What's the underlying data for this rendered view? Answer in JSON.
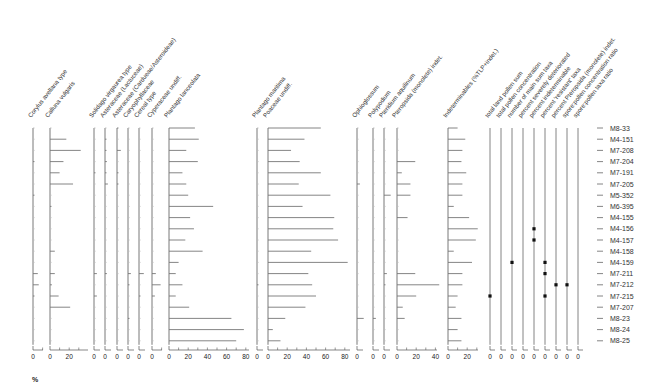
{
  "chart_data": {
    "type": "bar",
    "subtype": "stratigraphic pollen diagram (horizontal bars per sample)",
    "title": "",
    "xlabel": "%",
    "samples": [
      "M8-33",
      "M4-151",
      "M7-208",
      "M7-204",
      "M7-191",
      "M7-205",
      "M5-352",
      "M6-395",
      "M4-155",
      "M4-156",
      "M4-157",
      "M4-158",
      "M4-159",
      "M7-211",
      "M7-212",
      "M7-215",
      "M7-207",
      "M8-23",
      "M8-24",
      "M8-25"
    ],
    "series": [
      {
        "name": "Corylus avellana type",
        "x0": 33,
        "scale": 0.96,
        "ticks": [
          0
        ],
        "axis_len": 10,
        "values": [
          0,
          0,
          0,
          1,
          0,
          0,
          1,
          0,
          0,
          0,
          0,
          0,
          0,
          5,
          6,
          1,
          0,
          0,
          0,
          0
        ]
      },
      {
        "name": "Calluna vulgaris",
        "x0": 50,
        "scale": 0.96,
        "ticks": [
          0,
          20
        ],
        "axis_len": 38,
        "values": [
          0,
          17,
          32,
          14,
          10,
          24,
          0,
          1,
          0,
          0,
          0,
          5,
          0,
          5,
          2,
          9,
          21,
          0,
          0,
          0
        ]
      },
      {
        "name": "Solidago virgaurea type",
        "x0": 94,
        "scale": 0.96,
        "ticks": [
          0
        ],
        "axis_len": 6,
        "values": [
          0,
          0,
          0,
          0,
          1,
          0,
          0,
          0,
          0,
          0,
          0,
          0,
          0,
          3,
          0,
          3,
          0,
          0,
          0,
          0
        ]
      },
      {
        "name": "Asteraceae (Lactuceae)",
        "x0": 105,
        "scale": 0.96,
        "ticks": [
          0
        ],
        "axis_len": 6,
        "values": [
          0,
          1,
          1,
          2,
          1,
          3,
          0,
          0,
          0,
          0,
          0,
          0,
          0,
          2,
          0,
          0,
          0,
          0,
          0,
          0
        ]
      },
      {
        "name": "Asteraceae (Cardueae/Asteroideae)",
        "x0": 117,
        "scale": 0.96,
        "ticks": [
          0
        ],
        "axis_len": 6,
        "values": [
          1,
          0,
          4,
          0,
          1,
          1,
          0,
          0,
          0,
          0,
          0,
          0,
          0,
          0,
          0,
          0,
          0,
          0,
          0,
          0
        ]
      },
      {
        "name": "Caryophyllaceae",
        "x0": 128,
        "scale": 0.96,
        "ticks": [
          0
        ],
        "axis_len": 6,
        "values": [
          0,
          0,
          0,
          0,
          0,
          0,
          0,
          0,
          0,
          0,
          0,
          0,
          0,
          3,
          1,
          0,
          0,
          1,
          0,
          0
        ]
      },
      {
        "name": "Cereal type",
        "x0": 139,
        "scale": 0.96,
        "ticks": [
          0
        ],
        "axis_len": 6,
        "values": [
          0,
          0,
          0,
          0,
          0,
          0,
          0,
          0,
          0,
          0,
          0,
          0,
          0,
          5,
          0,
          1,
          0,
          0,
          0,
          0
        ]
      },
      {
        "name": "Cyperaceae undiff.",
        "x0": 152,
        "scale": 0.96,
        "ticks": [
          0
        ],
        "axis_len": 10,
        "values": [
          0,
          0,
          0,
          0,
          0,
          0,
          0,
          0,
          0,
          0,
          0,
          0,
          0,
          4,
          9,
          3,
          0,
          0,
          0,
          0
        ]
      },
      {
        "name": "Plantago lanceolata",
        "x0": 169,
        "scale": 0.96,
        "ticks": [
          0,
          20,
          40,
          60,
          80
        ],
        "axis_len": 80,
        "values": [
          27,
          31,
          18,
          30,
          14,
          18,
          20,
          46,
          22,
          26,
          17,
          35,
          10,
          7,
          14,
          7,
          21,
          65,
          78,
          70
        ]
      },
      {
        "name": "Plantago maritima",
        "x0": 257,
        "scale": 0.96,
        "ticks": [
          0
        ],
        "axis_len": 6,
        "values": [
          0,
          0,
          0,
          0,
          0,
          0,
          0,
          0,
          0,
          0,
          0,
          0,
          0,
          0,
          1,
          0,
          0,
          0,
          0,
          0
        ]
      },
      {
        "name": "Poaceae undiff.",
        "x0": 268,
        "scale": 0.96,
        "ticks": [
          0,
          20,
          40,
          60,
          80
        ],
        "axis_len": 82,
        "values": [
          55,
          38,
          24,
          33,
          55,
          32,
          65,
          36,
          69,
          68,
          73,
          45,
          83,
          42,
          46,
          50,
          39,
          18,
          5,
          13
        ]
      },
      {
        "name": "Ophioglossum",
        "x0": 357,
        "scale": 0.96,
        "ticks": [
          0
        ],
        "axis_len": 6,
        "values": [
          0,
          0,
          0,
          0,
          0,
          3,
          0,
          0,
          0,
          0,
          0,
          0,
          0,
          0,
          0,
          0,
          0,
          7,
          0,
          0
        ]
      },
      {
        "name": "Polypodium",
        "x0": 373,
        "scale": 0.96,
        "ticks": [
          0
        ],
        "axis_len": 6,
        "values": [
          0,
          0,
          0,
          0,
          0,
          0,
          0,
          0,
          0,
          0,
          0,
          0,
          0,
          0,
          0,
          0,
          0,
          3,
          0,
          0
        ]
      },
      {
        "name": "Pteridium aquilinum",
        "x0": 384,
        "scale": 0.96,
        "ticks": [
          0
        ],
        "axis_len": 6,
        "values": [
          0,
          0,
          0,
          0,
          0,
          0,
          7,
          0,
          0,
          0,
          0,
          0,
          0,
          3,
          1,
          0,
          0,
          0,
          0,
          0
        ]
      },
      {
        "name": "Pteropsida (monolete) indet.",
        "x0": 397,
        "scale": 0.96,
        "ticks": [
          0,
          20,
          40
        ],
        "axis_len": 40,
        "values": [
          0,
          0,
          0,
          19,
          5,
          14,
          14,
          0,
          11,
          0,
          0,
          0,
          0,
          19,
          44,
          20,
          6,
          8,
          0,
          0
        ]
      },
      {
        "name": "Indeterminables (%TLP+indet.)",
        "x0": 448,
        "scale": 0.96,
        "ticks": [
          0,
          20
        ],
        "axis_len": 30,
        "values": [
          10,
          18,
          15,
          14,
          19,
          15,
          15,
          6,
          22,
          31,
          29,
          6,
          25,
          15,
          15,
          10,
          8,
          14,
          10,
          14
        ]
      }
    ],
    "ratio_columns": [
      {
        "name": "total land pollen sum",
        "x0": 490,
        "dots": {
          "M7-215": 0
        }
      },
      {
        "name": "total pollen concentration",
        "x0": 501,
        "dots": {}
      },
      {
        "name": "number of main sum taxa",
        "x0": 512,
        "dots": {
          "M4-159": 0
        }
      },
      {
        "name": "percent severely deteriorated",
        "x0": 523,
        "dots": {}
      },
      {
        "name": "percent indeterminable",
        "x0": 534,
        "dots": {
          "M4-156": 0,
          "M4-157": 0
        }
      },
      {
        "name": "percent 'resistant' taxa",
        "x0": 545,
        "dots": {
          "M4-159": 0,
          "M7-211": 0,
          "M7-215": 0
        }
      },
      {
        "name": "percent Pteropsida (monolete) indet.",
        "x0": 556,
        "dots": {
          "M7-212": 0
        }
      },
      {
        "name": "spore:pollen concentration ratio",
        "x0": 567,
        "dots": {
          "M7-212": 0
        }
      },
      {
        "name": "spore:pollen taxa ratio",
        "x0": 578,
        "dots": {}
      }
    ],
    "grid": false,
    "legend": "none",
    "y_axis": "sample codes listed at right"
  },
  "labels": {
    "pct": "%"
  }
}
